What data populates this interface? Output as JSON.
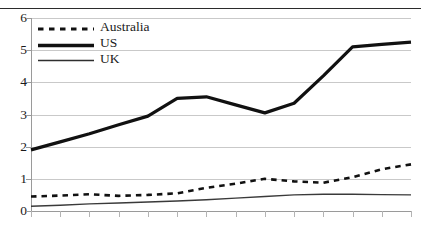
{
  "chart_data": {
    "type": "line",
    "title": "",
    "subtitle": "",
    "xlabel": "",
    "ylabel": "",
    "ylim": [
      0,
      6
    ],
    "ytick_labels": [
      "0",
      "1",
      "2",
      "3",
      "4",
      "5",
      "6"
    ],
    "ytick_values": [
      0,
      1,
      2,
      3,
      4,
      5,
      6
    ],
    "xtick_labels": [
      "",
      "",
      "",
      "",
      "",
      "",
      "",
      "",
      "",
      "",
      "",
      "",
      "",
      ""
    ],
    "x": [
      1,
      2,
      3,
      4,
      5,
      6,
      7,
      8,
      9,
      10,
      11,
      12,
      13,
      14
    ],
    "grid": true,
    "grid_axis": "y",
    "legend_position": "upper-left-inside",
    "series": [
      {
        "name": "Australia",
        "style": "dashed",
        "color": "#111111",
        "width": 2.6,
        "values": [
          0.45,
          0.48,
          0.52,
          0.47,
          0.5,
          0.55,
          0.72,
          0.85,
          1.0,
          0.92,
          0.88,
          1.05,
          1.3,
          1.45
        ]
      },
      {
        "name": "US",
        "style": "solid",
        "color": "#111111",
        "width": 3.2,
        "values": [
          1.9,
          2.15,
          2.4,
          2.68,
          2.95,
          3.5,
          3.55,
          3.3,
          3.05,
          3.35,
          4.2,
          5.1,
          5.18,
          5.25
        ]
      },
      {
        "name": "UK",
        "style": "solid",
        "color": "#3a3a3a",
        "width": 1.4,
        "values": [
          0.15,
          0.18,
          0.22,
          0.25,
          0.28,
          0.31,
          0.35,
          0.4,
          0.45,
          0.5,
          0.52,
          0.52,
          0.51,
          0.5
        ]
      }
    ]
  },
  "legend": {
    "items": [
      {
        "label": "Australia",
        "icon": "dashed-line-swatch"
      },
      {
        "label": "US",
        "icon": "thick-line-swatch"
      },
      {
        "label": "UK",
        "icon": "thin-line-swatch"
      }
    ]
  }
}
